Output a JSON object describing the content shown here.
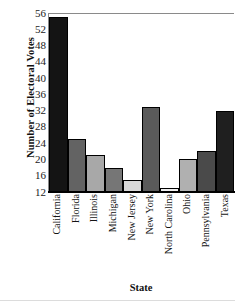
{
  "chart_data": {
    "type": "bar",
    "title": "",
    "xlabel": "State",
    "ylabel": "Number of Electoral Votes",
    "categories": [
      "California",
      "Florida",
      "Illinois",
      "Michigan",
      "New Jersey",
      "New York",
      "North Carolina",
      "Ohio",
      "Pennsylvania",
      "Texas"
    ],
    "values": [
      55,
      25,
      21,
      18,
      15,
      33,
      13,
      20,
      22,
      32
    ],
    "ylim": [
      12,
      56
    ],
    "yticks": [
      12,
      16,
      20,
      24,
      28,
      32,
      36,
      40,
      44,
      48,
      52,
      56
    ],
    "ytick_labels": [
      "12",
      "16",
      "20",
      "24",
      "28",
      "32",
      "36",
      "40",
      "44",
      "48",
      "52",
      "56"
    ],
    "grid": false,
    "legend": "none",
    "bar_colors": [
      "#141414",
      "#636363",
      "#a8a8a8",
      "#767676",
      "#d8d8d8",
      "#5a5a5a",
      "#f0f0f0",
      "#b0b0b0",
      "#4a4a4a",
      "#1f1f1f"
    ],
    "bar_edge_color": "#000000",
    "axis_color": "#8a8a8a",
    "background": "#ffffff"
  }
}
